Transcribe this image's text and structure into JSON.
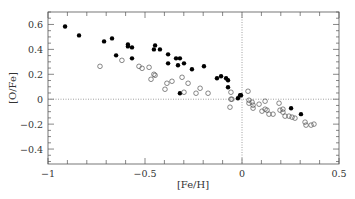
{
  "chart_data": {
    "type": "scatter",
    "title": "",
    "xlabel": "[Fe/H]",
    "ylabel": "[O/Fe]",
    "xlim": [
      -1.0,
      0.5
    ],
    "ylim": [
      -0.52,
      0.7
    ],
    "x_ticks": [
      -1,
      -0.5,
      0,
      0.5
    ],
    "x_tick_labels": [
      "−1",
      "−0.5",
      "0",
      "0.5"
    ],
    "y_ticks": [
      -0.4,
      -0.2,
      0,
      0.2,
      0.4,
      0.6
    ],
    "y_tick_labels": [
      "−0.4",
      "−0.2",
      "0",
      "0.2",
      "0.4",
      "0.6"
    ],
    "grid": false,
    "reference_lines": [
      {
        "orientation": "vertical",
        "value": 0,
        "style": "dotted"
      },
      {
        "orientation": "horizontal",
        "value": 0,
        "style": "dotted"
      }
    ],
    "legend": null,
    "series": [
      {
        "name": "filled",
        "marker": "filled-circle",
        "color": "#000000",
        "points": [
          [
            -0.912,
            0.584
          ],
          [
            -0.84,
            0.512
          ],
          [
            -0.711,
            0.464
          ],
          [
            -0.67,
            0.488
          ],
          [
            -0.649,
            0.352
          ],
          [
            -0.588,
            0.44
          ],
          [
            -0.588,
            0.424
          ],
          [
            -0.567,
            0.416
          ],
          [
            -0.567,
            0.328
          ],
          [
            -0.448,
            0.432
          ],
          [
            -0.454,
            0.4
          ],
          [
            -0.423,
            0.4
          ],
          [
            -0.381,
            0.36
          ],
          [
            -0.34,
            0.328
          ],
          [
            -0.32,
            0.328
          ],
          [
            -0.381,
            0.288
          ],
          [
            -0.33,
            0.272
          ],
          [
            -0.299,
            0.288
          ],
          [
            -0.258,
            0.24
          ],
          [
            -0.196,
            0.264
          ],
          [
            -0.32,
            0.048
          ],
          [
            -0.129,
            0.168
          ],
          [
            -0.108,
            0.184
          ],
          [
            -0.082,
            0.168
          ],
          [
            -0.072,
            0.152
          ],
          [
            -0.072,
            0.096
          ],
          [
            -0.021,
            0.008
          ],
          [
            -0.01,
            0.032
          ],
          [
            -0.005,
            0.032
          ],
          [
            0.253,
            -0.072
          ],
          [
            0.304,
            -0.12
          ]
        ]
      },
      {
        "name": "open",
        "marker": "open-circle",
        "color": "#555555",
        "points": [
          [
            -0.732,
            0.264
          ],
          [
            -0.619,
            0.312
          ],
          [
            -0.531,
            0.264
          ],
          [
            -0.515,
            0.248
          ],
          [
            -0.479,
            0.256
          ],
          [
            -0.454,
            0.2
          ],
          [
            -0.448,
            0.192
          ],
          [
            -0.469,
            0.16
          ],
          [
            -0.387,
            0.128
          ],
          [
            -0.361,
            0.144
          ],
          [
            -0.397,
            0.08
          ],
          [
            -0.309,
            0.176
          ],
          [
            -0.278,
            0.128
          ],
          [
            -0.299,
            0.056
          ],
          [
            -0.237,
            0.048
          ],
          [
            -0.216,
            0.088
          ],
          [
            -0.175,
            0.048
          ],
          [
            -0.057,
            0.056
          ],
          [
            -0.057,
            0.0
          ],
          [
            -0.052,
            0.0
          ],
          [
            -0.062,
            -0.064
          ],
          [
            0.031,
            0.064
          ],
          [
            0.036,
            -0.008
          ],
          [
            0.036,
            -0.032
          ],
          [
            0.052,
            -0.024
          ],
          [
            0.057,
            -0.048
          ],
          [
            0.057,
            -0.072
          ],
          [
            0.088,
            -0.04
          ],
          [
            0.119,
            -0.016
          ],
          [
            0.103,
            -0.096
          ],
          [
            0.119,
            -0.08
          ],
          [
            0.129,
            -0.088
          ],
          [
            0.139,
            -0.12
          ],
          [
            0.16,
            -0.12
          ],
          [
            0.191,
            -0.032
          ],
          [
            0.196,
            -0.088
          ],
          [
            0.211,
            -0.08
          ],
          [
            0.211,
            -0.104
          ],
          [
            0.222,
            -0.136
          ],
          [
            0.242,
            -0.136
          ],
          [
            0.258,
            -0.144
          ],
          [
            0.273,
            -0.152
          ],
          [
            0.325,
            -0.184
          ],
          [
            0.33,
            -0.208
          ],
          [
            0.356,
            -0.208
          ],
          [
            0.371,
            -0.2
          ]
        ]
      }
    ]
  },
  "layout": {
    "plot_left": 48,
    "plot_right": 339,
    "plot_top": 12,
    "plot_bottom": 164,
    "axis_color": "#555555",
    "ref_line_color": "#888888"
  }
}
